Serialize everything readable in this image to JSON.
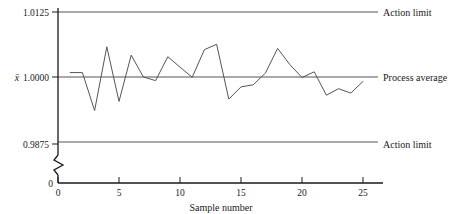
{
  "chart_data": {
    "type": "line",
    "title": "",
    "xlabel": "Sample number",
    "ylabel": "x̄",
    "x": [
      1,
      2,
      3,
      4,
      5,
      6,
      7,
      8,
      9,
      10,
      11,
      12,
      13,
      14,
      15,
      16,
      17,
      18,
      19,
      20,
      21,
      22,
      23,
      24,
      25
    ],
    "values": [
      1.00085,
      1.00085,
      0.99355,
      1.0058,
      0.9953,
      1.0042,
      1.0,
      0.9993,
      1.0039,
      1.0019,
      0.99995,
      1.00525,
      1.0063,
      0.99575,
      0.9981,
      0.9985,
      1.00075,
      1.0055,
      1.0024,
      0.9999,
      1.001,
      0.9965,
      0.99775,
      0.9969,
      0.99915
    ],
    "series": [
      {
        "name": "Sample mean",
        "values": [
          1.00085,
          1.00085,
          0.99355,
          1.0058,
          0.9953,
          1.0042,
          1.0,
          0.9993,
          1.0039,
          1.0019,
          0.99995,
          1.00525,
          1.0063,
          0.99575,
          0.9981,
          0.9985,
          1.00075,
          1.0055,
          1.0024,
          0.9999,
          1.001,
          0.9965,
          0.99775,
          0.9969,
          0.99915
        ]
      }
    ],
    "xlim": [
      0,
      26
    ],
    "ylim": [
      0.9875,
      1.0125
    ],
    "xticks": [
      0,
      5,
      10,
      15,
      20,
      25
    ],
    "xtick_labels": [
      "0",
      "5",
      "10",
      "15",
      "20",
      "25"
    ],
    "yticks": [
      0.9875,
      1.0,
      1.0125
    ],
    "ytick_labels": [
      "0.9875",
      "1.0000",
      "1.0125"
    ],
    "y_origin_label": "0",
    "grid": false,
    "legend": "right-inline",
    "axis_break": true,
    "reference_lines": [
      {
        "name": "upper-action-limit",
        "value": 1.0125,
        "label": "Action limit"
      },
      {
        "name": "process-average",
        "value": 1.0,
        "label": "Process average"
      },
      {
        "name": "lower-action-limit",
        "value": 0.9875,
        "label": "Action limit"
      }
    ],
    "colors": {
      "series_line": "#555555",
      "reference_line": "#555555",
      "axis": "#1a1a1a",
      "text": "#1a1a1a",
      "background": "#ffffff"
    }
  },
  "axis": {
    "y_label": "x̄",
    "x_label": "Sample number",
    "y_tick_top": "1.0125",
    "y_tick_mid": "1.0000",
    "y_tick_low": "0.9875",
    "y_tick_zero": "0",
    "x_tick_0": "0",
    "x_tick_5": "5",
    "x_tick_10": "10",
    "x_tick_15": "15",
    "x_tick_20": "20",
    "x_tick_25": "25"
  },
  "annotations": {
    "upper_action_limit": "Action limit",
    "process_average": "Process average",
    "lower_action_limit": "Action limit"
  }
}
